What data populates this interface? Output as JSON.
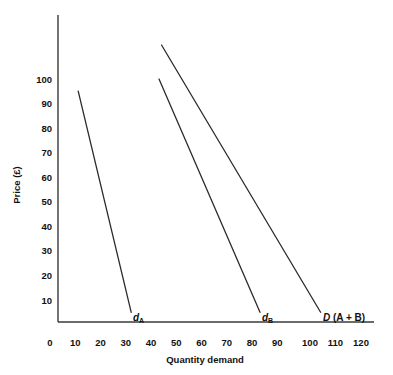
{
  "chart_data": {
    "type": "line",
    "title": "",
    "subtitle": "",
    "xlabel": "Quantity demand",
    "ylabel": "Price (£)",
    "xlim": [
      0,
      120
    ],
    "ylim": [
      0,
      120
    ],
    "x_ticks": [
      0,
      10,
      20,
      30,
      40,
      50,
      60,
      70,
      80,
      90,
      100,
      110,
      120
    ],
    "x_tick_labels": [
      "0",
      "10",
      "20",
      "30",
      "40",
      "50",
      "60",
      "70",
      "80",
      "90",
      "100",
      "110",
      "120"
    ],
    "y_ticks": [
      10,
      20,
      30,
      40,
      50,
      60,
      70,
      80,
      90,
      100
    ],
    "y_tick_labels": [
      "10",
      "20",
      "30",
      "40",
      "50",
      "60",
      "70",
      "80",
      "90",
      "100"
    ],
    "grid": false,
    "legend_position": "inline-annotations",
    "series": [
      {
        "name": "d_A",
        "label_symbol": "d",
        "label_subscript": "A",
        "label_suffix": "",
        "points": [
          {
            "x": 8,
            "y": 95
          },
          {
            "x": 29,
            "y": 4
          }
        ]
      },
      {
        "name": "d_B",
        "label_symbol": "d",
        "label_subscript": "B",
        "label_suffix": "",
        "points": [
          {
            "x": 40,
            "y": 100
          },
          {
            "x": 80,
            "y": 4
          }
        ]
      },
      {
        "name": "D (A + B)",
        "label_symbol": "D",
        "label_subscript": "",
        "label_suffix": " (A + B)",
        "points": [
          {
            "x": 41,
            "y": 114
          },
          {
            "x": 104,
            "y": 4
          }
        ]
      }
    ],
    "annotations": [
      {
        "text": "d",
        "subscript": "A",
        "x": 31,
        "y": 2
      },
      {
        "text": "d",
        "subscript": "B",
        "x": 82,
        "y": 2
      },
      {
        "text": "D (A + B)",
        "subscript": "",
        "x": 106,
        "y": 2
      }
    ]
  },
  "axes": {
    "y_title": "Price (£)",
    "x_title": "Quantity demand",
    "x_tick_0": "0",
    "x_tick_10": "10",
    "x_tick_20": "20",
    "x_tick_30": "30",
    "x_tick_40": "40",
    "x_tick_50": "50",
    "x_tick_60": "60",
    "x_tick_70": "70",
    "x_tick_80": "80",
    "x_tick_90": "90",
    "x_tick_100": "100",
    "x_tick_110": "110",
    "x_tick_120": "120",
    "y_tick_10": "10",
    "y_tick_20": "20",
    "y_tick_30": "30",
    "y_tick_40": "40",
    "y_tick_50": "50",
    "y_tick_60": "60",
    "y_tick_70": "70",
    "y_tick_80": "80",
    "y_tick_90": "90",
    "y_tick_100": "100"
  },
  "labels": {
    "curve_a_symbol": "d",
    "curve_a_sub": "A",
    "curve_b_symbol": "d",
    "curve_b_sub": "B",
    "curve_d_symbol": "D",
    "curve_d_suffix": " (A + B)"
  },
  "colors": {
    "axis": "#3a3a3a",
    "curve": "#2b2b2b",
    "text": "#111111",
    "background": "#ffffff"
  }
}
